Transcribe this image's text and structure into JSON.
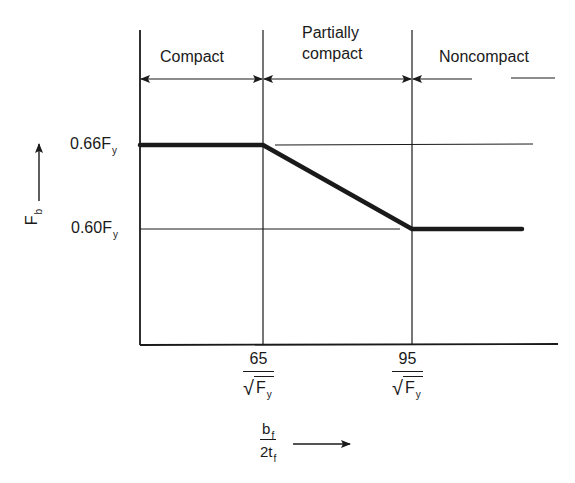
{
  "diagram": {
    "type": "allowable-bending-stress-vs-flange-slenderness",
    "regions": [
      {
        "name": "Compact",
        "label_lines": [
          "Compact"
        ]
      },
      {
        "name": "Partially compact",
        "label_lines": [
          "Partially",
          "compact"
        ]
      },
      {
        "name": "Noncompact",
        "label_lines": [
          "Noncompact"
        ]
      }
    ],
    "y_axis": {
      "symbol": "F",
      "subscript": "b",
      "ticks": [
        {
          "value": 0.66,
          "text": "0.66F",
          "sub": "y"
        },
        {
          "value": 0.6,
          "text": "0.60F",
          "sub": "y"
        }
      ]
    },
    "x_axis": {
      "numerator": "b",
      "numerator_sub": "f",
      "denominator": "2t",
      "denominator_sub": "f",
      "ticks": [
        {
          "value": 65,
          "num": "65",
          "den": "F",
          "den_sub": "y",
          "radical": "√"
        },
        {
          "value": 95,
          "num": "95",
          "den": "F",
          "den_sub": "y",
          "radical": "√"
        }
      ]
    },
    "curve": [
      {
        "x": "start",
        "y": 0.66
      },
      {
        "x": 65,
        "y": 0.66
      },
      {
        "x": 95,
        "y": 0.6
      },
      {
        "x": "end",
        "y": 0.6
      }
    ],
    "colors": {
      "ink": "#1a1a1a",
      "background": "#ffffff"
    }
  }
}
